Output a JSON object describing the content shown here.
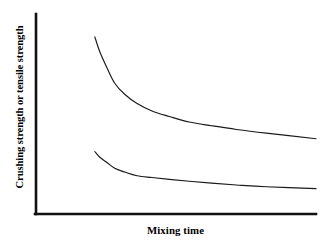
{
  "chart_data": {
    "type": "line",
    "title": "",
    "subtitle": "",
    "xlabel": "Mixing time",
    "ylabel": "Crushing strength or tensile strength",
    "xlim": [
      0,
      100
    ],
    "ylim": [
      0,
      100
    ],
    "grid": false,
    "legend": null,
    "axis_ticks": {
      "x": [],
      "y": []
    },
    "annotations": [],
    "colors": {
      "background": "#ffffff",
      "axis": "#111111",
      "curve": "#1a1a1a"
    },
    "series": [
      {
        "name": "Crushing strength",
        "shape": "decaying",
        "x": [
          11,
          13,
          16,
          19,
          23,
          28,
          34,
          41,
          49,
          58,
          68,
          80,
          100
        ],
        "y": [
          93,
          85,
          76,
          68,
          62,
          57,
          53,
          50,
          47,
          45,
          43,
          41,
          38
        ]
      },
      {
        "name": "Tensile strength",
        "shape": "decaying",
        "x": [
          11,
          13,
          16,
          19,
          23,
          28,
          34,
          41,
          49,
          58,
          68,
          80,
          100
        ],
        "y": [
          31,
          28,
          25,
          22,
          20,
          18,
          17,
          16,
          15,
          14,
          13,
          12,
          11
        ]
      }
    ]
  }
}
